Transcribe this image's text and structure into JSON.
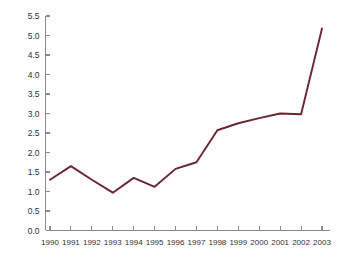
{
  "chart_data": {
    "type": "line",
    "title": "",
    "xlabel": "",
    "ylabel": "",
    "categories": [
      "1990",
      "1991",
      "1992",
      "1993",
      "1994",
      "1995",
      "1996",
      "1997",
      "1998",
      "1999",
      "2000",
      "2001",
      "2002",
      "2003"
    ],
    "values": [
      1.3,
      1.65,
      1.3,
      0.97,
      1.35,
      1.12,
      1.58,
      1.75,
      2.57,
      2.75,
      2.88,
      3.0,
      2.98,
      5.18
    ],
    "series": [
      {
        "name": "",
        "color": "#6b2530",
        "values": [
          1.3,
          1.65,
          1.3,
          0.97,
          1.35,
          1.12,
          1.58,
          1.75,
          2.57,
          2.75,
          2.88,
          3.0,
          2.98,
          5.18
        ]
      }
    ],
    "ylim": [
      0.0,
      5.5
    ],
    "ytick_values": [
      0.0,
      0.5,
      1.0,
      1.5,
      2.0,
      2.5,
      3.0,
      3.5,
      4.0,
      4.5,
      5.0,
      5.5
    ],
    "ytick_labels": [
      "0.0",
      "0.5",
      "1.0",
      "1.5",
      "2.0",
      "2.5",
      "3.0",
      "3.5",
      "4.0",
      "4.5",
      "5.0",
      "5.5"
    ],
    "xtick_labels": [
      "1990",
      "1991",
      "1992",
      "1993",
      "1994",
      "1995",
      "1996",
      "1997",
      "1998",
      "1999",
      "2000",
      "2001",
      "2002",
      "2003"
    ],
    "grid": false,
    "legend": false,
    "legend_position": "none",
    "markers": false,
    "annotations": []
  },
  "figure": {
    "title_clipped": "",
    "line_color": "#6b2530",
    "axis_color": "#8a8a8a",
    "tick_label_color": "#2f2f2f",
    "background_color": "#ffffff"
  }
}
